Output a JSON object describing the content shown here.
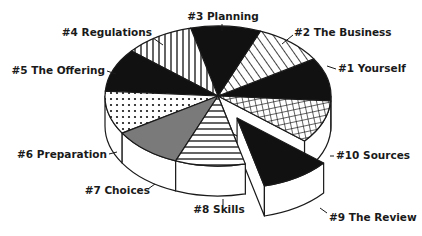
{
  "chart_data": {
    "type": "pie",
    "style": "3d-exploded",
    "title": "",
    "slices": [
      {
        "label": "#1 Yourself",
        "value": 10,
        "fill": "solid-black",
        "exploded": false
      },
      {
        "label": "#2 The Business",
        "value": 10,
        "fill": "diagonal-hatch",
        "exploded": false
      },
      {
        "label": "#3 Planning",
        "value": 10,
        "fill": "solid-black",
        "exploded": false
      },
      {
        "label": "#4 Regulations",
        "value": 10,
        "fill": "vertical-hatch",
        "exploded": false
      },
      {
        "label": "#5 The Offering",
        "value": 10,
        "fill": "solid-black",
        "exploded": false
      },
      {
        "label": "#6 Preparation",
        "value": 10,
        "fill": "dots",
        "exploded": false
      },
      {
        "label": "#7 Choices",
        "value": 10,
        "fill": "solid-gray",
        "exploded": false
      },
      {
        "label": "#8 Skills",
        "value": 10,
        "fill": "horizontal-hatch",
        "exploded": false
      },
      {
        "label": "#9 The Review",
        "value": 10,
        "fill": "solid-black",
        "exploded": true
      },
      {
        "label": "#10 Sources",
        "value": 10,
        "fill": "grid-hatch",
        "exploded": false
      }
    ],
    "colors": {
      "black": "#111111",
      "gray": "#7a7a7a",
      "white": "#ffffff",
      "stroke": "#1a1a1a"
    },
    "legend": "none"
  }
}
